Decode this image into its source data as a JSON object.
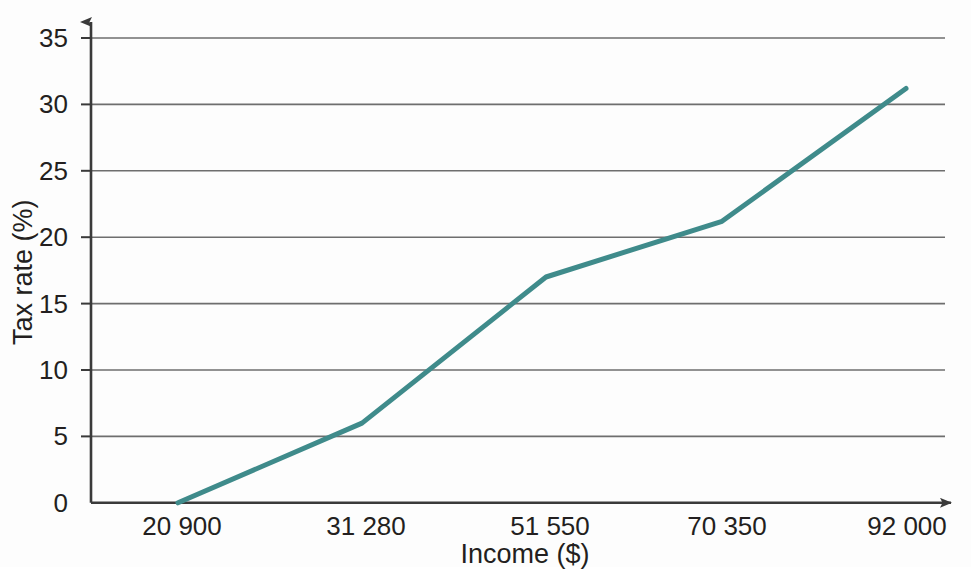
{
  "chart_data": {
    "type": "line",
    "title": "",
    "xlabel": "Income ($)",
    "ylabel": "Tax rate (%)",
    "x": [
      20900,
      31280,
      51550,
      70350,
      92000
    ],
    "values": [
      0,
      6,
      17,
      21.2,
      31.2
    ],
    "series": [
      {
        "name": "Tax rate",
        "color": "#3f8b8b",
        "points": [
          {
            "x": 20900,
            "y": 0
          },
          {
            "x": 31280,
            "y": 6
          },
          {
            "x": 51550,
            "y": 17
          },
          {
            "x": 70350,
            "y": 21.2
          },
          {
            "x": 92000,
            "y": 31.2
          }
        ]
      }
    ],
    "x_tick_labels": [
      "20 900",
      "31 280",
      "51 550",
      "70 350",
      "92 000"
    ],
    "y_tick_labels": [
      "0",
      "5",
      "10",
      "15",
      "20",
      "25",
      "30",
      "35"
    ],
    "y_ticks": [
      0,
      5,
      10,
      15,
      20,
      25,
      30,
      35
    ],
    "ylim": [
      0,
      36.5
    ],
    "xlim": [
      14500,
      97500
    ],
    "grid": "horizontal",
    "legend": "none",
    "axis_color": "#3a3a3a",
    "grid_color": "#6e6e6e",
    "line_color": "#3f8b8b",
    "line_width": 5,
    "arrows": [
      "y-axis-top",
      "x-axis-right"
    ]
  }
}
